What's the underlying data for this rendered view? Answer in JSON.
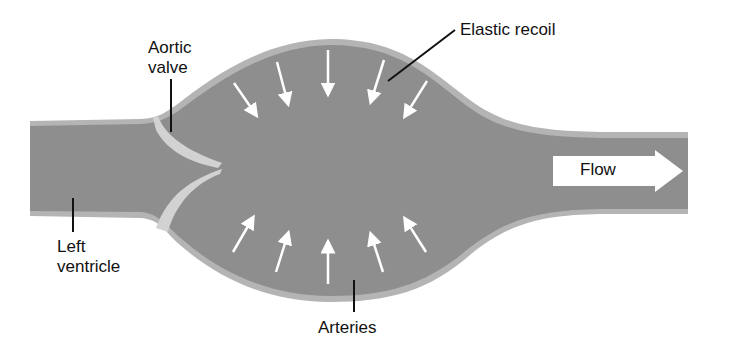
{
  "diagram": {
    "type": "anatomical-schematic",
    "colors": {
      "vessel_fill": "#8e8e8e",
      "vessel_wall": "#b4b4b4",
      "valve": "#d2d2d2",
      "arrows": "#ffffff",
      "leader_lines": "#111111"
    },
    "labels": {
      "aortic_valve": [
        "Aortic",
        "valve"
      ],
      "elastic_recoil": "Elastic recoil",
      "left_ventricle": [
        "Left",
        "ventricle"
      ],
      "arteries": "Arteries",
      "flow": "Flow"
    },
    "arrows": {
      "top_inward_count": 5,
      "bottom_inward_count": 5
    }
  }
}
